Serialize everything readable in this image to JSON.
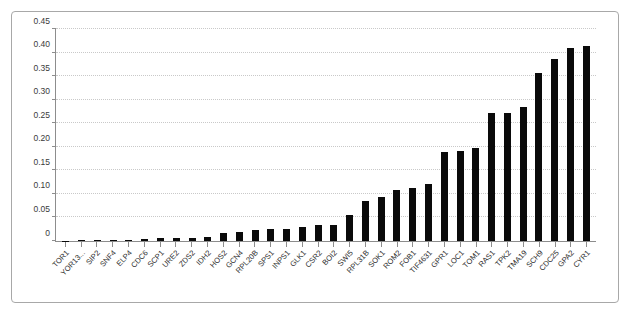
{
  "chart_data": {
    "type": "bar",
    "title": "",
    "subtitle": "",
    "xlabel": "",
    "ylabel": "",
    "ylim": [
      0,
      0.45
    ],
    "yticks": [
      "0",
      "0.05",
      "0.10",
      "0.15",
      "0.20",
      "0.25",
      "0.30",
      "0.35",
      "0.40",
      "0.45"
    ],
    "ytick_values": [
      0,
      0.05,
      0.1,
      0.15,
      0.2,
      0.25,
      0.3,
      0.35,
      0.4,
      0.45
    ],
    "grid": "horizontal-dotted",
    "legend": "none",
    "bar_color": "#0a0a0a",
    "categories": [
      "TOR1",
      "YOR13...",
      "SIP2",
      "SNF4",
      "ELP4",
      "CDC6",
      "SCP1",
      "URE2",
      "ZDS2",
      "IDH2",
      "HOS2",
      "GCN4",
      "RPL20B",
      "SPS1",
      "INPS1",
      "GLK1",
      "CSR2",
      "BOI2",
      "SWI5",
      "RPL31B",
      "SOK1",
      "ROM2",
      "FOB1",
      "TIF4631",
      "GPR1",
      "LOC1",
      "TOM1",
      "RAS1",
      "TPK2",
      "TMA19",
      "SCH9",
      "CDC25",
      "GPA2",
      "CYR1"
    ],
    "values": [
      0.001,
      0.0015,
      0.002,
      0.002,
      0.003,
      0.004,
      0.006,
      0.006,
      0.007,
      0.008,
      0.016,
      0.02,
      0.023,
      0.025,
      0.026,
      0.029,
      0.033,
      0.035,
      0.055,
      0.086,
      0.093,
      0.109,
      0.113,
      0.122,
      0.19,
      0.192,
      0.198,
      0.272,
      0.272,
      0.284,
      0.357,
      0.386,
      0.409,
      0.415
    ]
  }
}
